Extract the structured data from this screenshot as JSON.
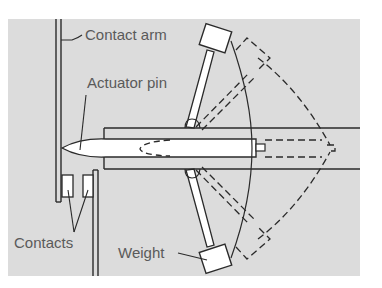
{
  "diagram": {
    "type": "mechanism-schematic",
    "colors": {
      "panel": "#dcdcdc",
      "line": "#2a2a2a",
      "fill": "#ffffff",
      "label": "#5a5a5a"
    },
    "labels": {
      "contact_arm": "Contact arm",
      "actuator_pin": "Actuator pin",
      "contacts": "Contacts",
      "weight": "Weight"
    },
    "states": [
      {
        "name": "rest",
        "style": "solid"
      },
      {
        "name": "actuated",
        "style": "dashed"
      }
    ]
  }
}
